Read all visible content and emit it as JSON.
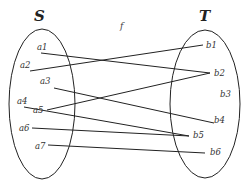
{
  "diagram": {
    "type": "function-mapping",
    "mapping_label": "f",
    "domain_set": {
      "name": "S",
      "elements": [
        {
          "id": "a1",
          "label": "a1",
          "lx": 37,
          "ly": 50,
          "x": 41,
          "y": 53
        },
        {
          "id": "a2",
          "label": "a2",
          "lx": 20,
          "ly": 68,
          "x": 30,
          "y": 71
        },
        {
          "id": "a3",
          "label": "a3",
          "lx": 40,
          "ly": 84,
          "x": 54,
          "y": 88
        },
        {
          "id": "a4",
          "label": "a4",
          "lx": 17,
          "ly": 104,
          "x": 24,
          "y": 107
        },
        {
          "id": "a5",
          "label": "a5",
          "lx": 33,
          "ly": 113,
          "x": 47,
          "y": 110
        },
        {
          "id": "a6",
          "label": "a6",
          "lx": 19,
          "ly": 131,
          "x": 32,
          "y": 128
        },
        {
          "id": "a7",
          "label": "a7",
          "lx": 35,
          "ly": 149,
          "x": 48,
          "y": 145
        }
      ]
    },
    "codomain_set": {
      "name": "T",
      "elements": [
        {
          "id": "b1",
          "label": "b1",
          "lx": 206,
          "ly": 48,
          "x": 203,
          "y": 45
        },
        {
          "id": "b2",
          "label": "b2",
          "lx": 214,
          "ly": 76,
          "x": 210,
          "y": 73
        },
        {
          "id": "b3",
          "label": "b3",
          "lx": 220,
          "ly": 97,
          "x": 220,
          "y": 94
        },
        {
          "id": "b4",
          "label": "b4",
          "lx": 214,
          "ly": 123,
          "x": 214,
          "y": 123
        },
        {
          "id": "b5",
          "label": "b5",
          "lx": 193,
          "ly": 138,
          "x": 189,
          "y": 136
        },
        {
          "id": "b6",
          "label": "b6",
          "lx": 210,
          "ly": 155,
          "x": 205,
          "y": 153
        }
      ]
    },
    "edges": [
      {
        "from": "a1",
        "to": "b2"
      },
      {
        "from": "a2",
        "to": "b1"
      },
      {
        "from": "a3",
        "to": "b4"
      },
      {
        "from": "a4",
        "to": "b5"
      },
      {
        "from": "a5",
        "to": "b2"
      },
      {
        "from": "a6",
        "to": "b5"
      },
      {
        "from": "a7",
        "to": "b6"
      }
    ]
  }
}
